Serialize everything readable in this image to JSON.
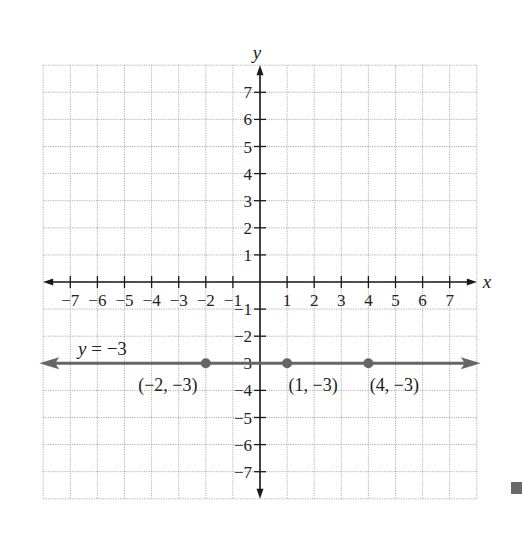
{
  "chart_data": {
    "type": "line",
    "title": "",
    "xlabel": "x",
    "ylabel": "y",
    "xlim": [
      -8,
      8
    ],
    "ylim": [
      -8,
      8
    ],
    "grid": true,
    "x_ticks": [
      -7,
      -6,
      -5,
      -4,
      -3,
      -2,
      -1,
      1,
      2,
      3,
      4,
      5,
      6,
      7
    ],
    "y_ticks": [
      7,
      6,
      5,
      4,
      3,
      2,
      1,
      -1,
      -2,
      -3,
      -4,
      -5,
      -6,
      -7
    ],
    "x_tick_labels": [
      "−7",
      "−6",
      "−5",
      "−4",
      "−3",
      "−2",
      "−1",
      "1",
      "2",
      "3",
      "4",
      "5",
      "6",
      "7"
    ],
    "y_tick_labels": [
      "7",
      "6",
      "5",
      "4",
      "3",
      "2",
      "1",
      "−1",
      "−2",
      "−3",
      "−4",
      "−5",
      "−6",
      "−7"
    ],
    "series": [
      {
        "name": "y = −3",
        "kind": "horizontal line with arrows both ends",
        "equation": "y = -3",
        "color": "#666666"
      }
    ],
    "points": [
      {
        "x": -2,
        "y": -3,
        "label": "(−2, −3)"
      },
      {
        "x": 1,
        "y": -3,
        "label": "(1, −3)"
      },
      {
        "x": 4,
        "y": -3,
        "label": "(4, −3)"
      }
    ],
    "annotations": [
      {
        "text": "y = −3",
        "position": "above line, left side"
      }
    ]
  },
  "labels": {
    "x_axis": "x",
    "y_axis": "y",
    "line_label": "y = −3"
  },
  "colors": {
    "axis": "#1a1a1a",
    "grid": "#9a9a9a",
    "line": "#666666",
    "points": "#666666",
    "corner_mark": "#6a6a6a"
  }
}
